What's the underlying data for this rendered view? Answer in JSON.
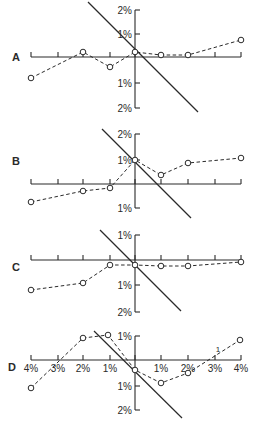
{
  "chart_data": [
    {
      "type": "line",
      "panel": "A",
      "x": [
        -4,
        -2,
        -1,
        0,
        1,
        2,
        4
      ],
      "x_unit": "%",
      "series": [
        {
          "name": "observed",
          "style": "dashed with open circles",
          "values": [
            -0.85,
            0.2,
            -0.4,
            0.2,
            0.1,
            0.1,
            0.7
          ]
        }
      ],
      "reference_line": {
        "style": "solid diagonal",
        "from": [
          -2.0,
          2.3
        ],
        "to": [
          2.4,
          -2.2
        ]
      },
      "y_ticks": [
        "2%",
        "1%",
        "1%",
        "2%"
      ],
      "ylim": [
        -2,
        2
      ],
      "xlim": [
        -4,
        4
      ]
    },
    {
      "type": "line",
      "panel": "B",
      "x": [
        -4,
        -2,
        -1,
        0,
        1,
        2,
        4
      ],
      "x_unit": "%",
      "series": [
        {
          "name": "observed",
          "style": "dashed with open circles",
          "values": [
            -0.75,
            -0.3,
            -0.2,
            1.0,
            0.35,
            0.85,
            1.05
          ]
        }
      ],
      "reference_line": {
        "style": "solid diagonal",
        "from": [
          -1.3,
          2.2
        ],
        "to": [
          2.2,
          -1.4
        ]
      },
      "y_ticks": [
        "2%",
        "1%",
        "1%"
      ],
      "ylim": [
        -1,
        2
      ],
      "xlim": [
        -4,
        4
      ]
    },
    {
      "type": "line",
      "panel": "C",
      "x": [
        -4,
        -2,
        -1,
        0,
        1,
        2,
        4
      ],
      "x_unit": "%",
      "series": [
        {
          "name": "observed",
          "style": "dashed with open circles",
          "values": [
            -1.2,
            -0.9,
            -0.2,
            -0.2,
            -0.25,
            -0.25,
            -0.1
          ]
        }
      ],
      "reference_line": {
        "style": "solid diagonal",
        "from": [
          -1.4,
          1.2
        ],
        "to": [
          1.8,
          -2.0
        ]
      },
      "y_ticks": [
        "1%",
        "1%",
        "2%"
      ],
      "ylim": [
        -2,
        1
      ],
      "xlim": [
        -4,
        4
      ]
    },
    {
      "type": "line",
      "panel": "D",
      "x": [
        -4,
        -2,
        -1,
        0,
        1,
        2,
        4
      ],
      "x_unit": "%",
      "series": [
        {
          "name": "observed",
          "style": "dashed with open circles",
          "values": [
            -1.15,
            0.9,
            1.0,
            -0.4,
            -0.95,
            -0.55,
            0.85
          ]
        }
      ],
      "reference_line": {
        "style": "solid diagonal",
        "from": [
          -1.6,
          1.2
        ],
        "to": [
          1.8,
          -2.3
        ]
      },
      "x_ticks": [
        "4%",
        "3%",
        "2%",
        "1%",
        "1%",
        "2%",
        "3%",
        "4%"
      ],
      "y_ticks": [
        "1%",
        "1%",
        "2%"
      ],
      "annotations": [
        "1"
      ],
      "ylim": [
        -2,
        1
      ],
      "xlim": [
        -4,
        4
      ]
    }
  ],
  "figure": {
    "panels": [
      {
        "label": "A",
        "label_pos": [
          12,
          61
        ],
        "axis_y": 57,
        "vaxis": {
          "top": 10,
          "bottom": 108
        },
        "yticks": [
          {
            "y": 10,
            "text": "2%"
          },
          {
            "y": 34,
            "text": "1%"
          },
          {
            "y": 83,
            "text": "1%"
          },
          {
            "y": 108,
            "text": "2%"
          }
        ],
        "points": [
          [
            31,
            78
          ],
          [
            83,
            52
          ],
          [
            110,
            67
          ],
          [
            135,
            52
          ],
          [
            161,
            55
          ],
          [
            188,
            55
          ],
          [
            241,
            40
          ]
        ],
        "diag": [
          88,
          2,
          198,
          112
        ]
      },
      {
        "label": "B",
        "label_pos": [
          12,
          165
        ],
        "axis_y": 184,
        "vaxis": {
          "top": 134,
          "bottom": 208
        },
        "yticks": [
          {
            "y": 134,
            "text": "2%"
          },
          {
            "y": 160,
            "text": "1%"
          },
          {
            "y": 208,
            "text": "1%"
          }
        ],
        "points": [
          [
            31,
            202
          ],
          [
            83,
            191
          ],
          [
            110,
            188
          ],
          [
            135,
            160
          ],
          [
            161,
            175
          ],
          [
            188,
            163
          ],
          [
            241,
            158
          ]
        ],
        "diag": [
          102,
          129,
          191,
          218
        ]
      },
      {
        "label": "C",
        "label_pos": [
          12,
          271
        ],
        "axis_y": 260,
        "vaxis": {
          "top": 235,
          "bottom": 312
        },
        "yticks": [
          {
            "y": 235,
            "text": "1%"
          },
          {
            "y": 285,
            "text": "1%"
          },
          {
            "y": 312,
            "text": "2%"
          }
        ],
        "points": [
          [
            31,
            290
          ],
          [
            83,
            283
          ],
          [
            110,
            265
          ],
          [
            135,
            265
          ],
          [
            161,
            266
          ],
          [
            188,
            266
          ],
          [
            241,
            262
          ]
        ],
        "diag": [
          100,
          230,
          181,
          311
        ]
      },
      {
        "label": "D",
        "label_pos": [
          8,
          371
        ],
        "axis_y": 360,
        "vaxis": {
          "top": 336,
          "bottom": 410
        },
        "yticks": [
          {
            "y": 336,
            "text": "1%"
          },
          {
            "y": 386,
            "text": "1%"
          },
          {
            "y": 410,
            "text": "2%"
          }
        ],
        "xticklabels": [
          "4%",
          "3%",
          "2%",
          "1%",
          "",
          "1%",
          "2%",
          "3%",
          "4%"
        ],
        "points": [
          [
            31,
            388
          ],
          [
            83,
            338
          ],
          [
            108,
            335
          ],
          [
            135,
            370
          ],
          [
            161,
            383
          ],
          [
            188,
            373
          ],
          [
            240,
            340
          ]
        ],
        "diag": [
          94,
          331,
          182,
          418
        ],
        "annotation": {
          "text": "1",
          "x": 218,
          "y": 352
        }
      }
    ],
    "xticks": [
      31,
      58,
      83,
      110,
      135,
      161,
      188,
      215,
      241
    ],
    "vaxis_x": 135,
    "axis_x_range": [
      31,
      241
    ]
  }
}
